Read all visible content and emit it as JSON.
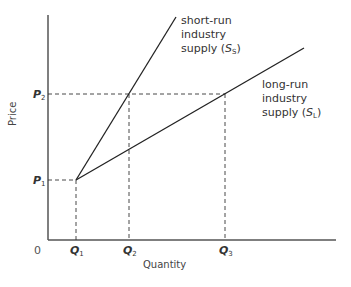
{
  "figure": {
    "type": "economics supply diagram",
    "axes": {
      "x_label": "Quantity",
      "y_label": "Price",
      "origin_label": "0"
    },
    "price_levels": [
      {
        "symbol": "P",
        "sub": "1",
        "y": 180
      },
      {
        "symbol": "P",
        "sub": "2",
        "y": 94
      }
    ],
    "quantity_levels": [
      {
        "symbol": "Q",
        "sub": "1",
        "x": 76
      },
      {
        "symbol": "Q",
        "sub": "2",
        "x": 129
      },
      {
        "symbol": "Q",
        "sub": "3",
        "x": 225
      }
    ],
    "curves": [
      {
        "id": "short-run",
        "label_lines": [
          "short-run",
          "industry",
          "supply ("
        ],
        "symbol": "S",
        "sub": "S",
        "close": ")",
        "from": [
          76,
          180
        ],
        "to": [
          176,
          17
        ]
      },
      {
        "id": "long-run",
        "label_lines": [
          "long-run",
          "industry",
          "supply ("
        ],
        "symbol": "S",
        "sub": "L",
        "close": ")",
        "from": [
          76,
          180
        ],
        "to": [
          304,
          48
        ]
      }
    ],
    "colors": {
      "axis": "#555555",
      "curve": "#222222",
      "guide": "#333333",
      "text": "#333333"
    }
  }
}
